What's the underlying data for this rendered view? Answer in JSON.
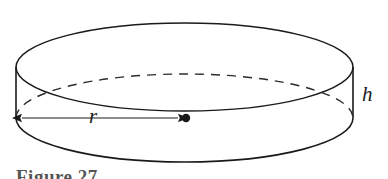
{
  "figure": {
    "type": "geometry-diagram",
    "background_color": "#ffffff",
    "stroke_color": "#1a1a1a",
    "width": 388,
    "height": 179
  },
  "labels": {
    "radius": "r",
    "height": "h"
  },
  "caption": {
    "text": "Figure 27",
    "note_cropped": "cut off at bottom edge"
  },
  "geometry": {
    "top_ellipse": {
      "cx": 184.5,
      "cy": 67,
      "rx": 168.5,
      "ry": 44
    },
    "bottom_ellipse": {
      "cx": 184.5,
      "cy": 118,
      "rx": 168.5,
      "ry": 44
    },
    "cylinder_height_px": 51,
    "left_side_x": 16,
    "right_side_x": 353,
    "center_dot": {
      "cx": 185,
      "cy": 118,
      "r": 4
    },
    "radius_arrow": {
      "x1": 20,
      "x2": 180,
      "y": 118,
      "double_headed": true
    },
    "hidden_back_arc_style": "dashed"
  }
}
